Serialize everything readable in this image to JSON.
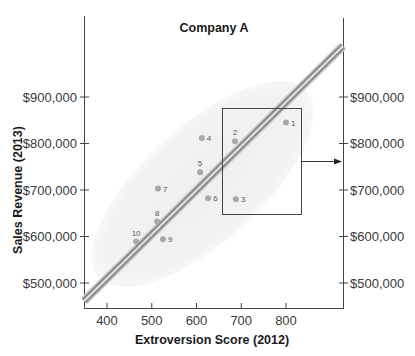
{
  "chart_data": {
    "type": "scatter",
    "title": "Company A",
    "xlabel": "Extroversion Score (2012)",
    "ylabel": "Sales Revenue (2013)",
    "xlim": [
      350,
      920
    ],
    "ylim": [
      450000,
      1030000
    ],
    "x_ticks": [
      400,
      500,
      600,
      700,
      800
    ],
    "x_tick_labels": [
      "400",
      "500",
      "600",
      "700",
      "800"
    ],
    "y_ticks": [
      500000,
      600000,
      700000,
      800000,
      900000
    ],
    "y_tick_labels": [
      "$500,000",
      "$600,000",
      "$700,000",
      "$800,000",
      "$900,000"
    ],
    "right_y_tick_labels": [
      "$500,000",
      "$600,000",
      "$700,000",
      "$800,000",
      "$900,000"
    ],
    "grid": false,
    "legend": null,
    "points": [
      {
        "label": "1",
        "x": 800,
        "y": 845000
      },
      {
        "label": "2",
        "x": 686,
        "y": 805000
      },
      {
        "label": "3",
        "x": 688,
        "y": 680000
      },
      {
        "label": "4",
        "x": 612,
        "y": 812000
      },
      {
        "label": "5",
        "x": 608,
        "y": 738000
      },
      {
        "label": "6",
        "x": 626,
        "y": 682000
      },
      {
        "label": "7",
        "x": 514,
        "y": 703000
      },
      {
        "label": "8",
        "x": 512,
        "y": 632000
      },
      {
        "label": "9",
        "x": 525,
        "y": 594000
      },
      {
        "label": "10",
        "x": 465,
        "y": 589000
      }
    ],
    "regression_line": {
      "x_start": 350,
      "y_start": 455000,
      "x_end": 920,
      "y_end": 1005000
    },
    "annotations": [
      {
        "type": "highlight-box",
        "x_range": [
          670,
          845
        ],
        "y_range": [
          655000,
          880000
        ],
        "contains": [
          "1",
          "2",
          "3"
        ]
      },
      {
        "type": "arrow",
        "from": "highlight-box",
        "to": "right-axis",
        "at_y": 760000
      }
    ],
    "colors": {
      "points": "#a8a8a8",
      "regression_line": "#8c8c8c",
      "ellipse": "#ececec",
      "axis": "#444444",
      "text": "#1a1a1a"
    }
  }
}
